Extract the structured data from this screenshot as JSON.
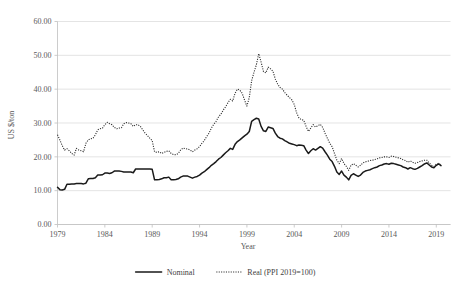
{
  "chart_data": {
    "type": "line",
    "title": "",
    "xlabel": "Year",
    "ylabel": "US $/ton",
    "xlim": [
      1979,
      2020.5
    ],
    "ylim": [
      0,
      60
    ],
    "grid": true,
    "legend_position": "bottom",
    "xticks": [
      "1979",
      "1984",
      "1989",
      "1994",
      "1999",
      "2004",
      "2009",
      "2014",
      "2019"
    ],
    "xtick_values": [
      1979,
      1984,
      1989,
      1994,
      1999,
      2004,
      2009,
      2014,
      2019
    ],
    "yticks": [
      "0.00",
      "10.00",
      "20.00",
      "30.00",
      "40.00",
      "50.00",
      "60.00"
    ],
    "ytick_values": [
      0,
      10,
      20,
      30,
      40,
      50,
      60
    ],
    "series": [
      {
        "name": "Nominal",
        "style": "solid",
        "color": "#1a1a1a",
        "x": [
          1979.0,
          1979.25,
          1979.5,
          1979.75,
          1980.0,
          1980.25,
          1980.5,
          1980.75,
          1981.0,
          1981.25,
          1981.5,
          1981.75,
          1982.0,
          1982.25,
          1982.5,
          1982.75,
          1983.0,
          1983.25,
          1983.5,
          1983.75,
          1984.0,
          1984.25,
          1984.5,
          1984.75,
          1985.0,
          1985.25,
          1985.5,
          1985.75,
          1986.0,
          1986.25,
          1986.5,
          1986.75,
          1987.0,
          1987.25,
          1987.5,
          1987.75,
          1988.0,
          1988.25,
          1988.5,
          1988.75,
          1989.0,
          1989.25,
          1989.5,
          1989.75,
          1990.0,
          1990.25,
          1990.5,
          1990.75,
          1991.0,
          1991.25,
          1991.5,
          1991.75,
          1992.0,
          1992.25,
          1992.5,
          1992.75,
          1993.0,
          1993.25,
          1993.5,
          1993.75,
          1994.0,
          1994.25,
          1994.5,
          1994.75,
          1995.0,
          1995.25,
          1995.5,
          1995.75,
          1996.0,
          1996.25,
          1996.5,
          1996.75,
          1997.0,
          1997.25,
          1997.5,
          1997.75,
          1998.0,
          1998.25,
          1998.5,
          1998.75,
          1999.0,
          1999.25,
          1999.5,
          1999.75,
          2000.0,
          2000.25,
          2000.5,
          2000.75,
          2001.0,
          2001.25,
          2001.5,
          2001.75,
          2002.0,
          2002.25,
          2002.5,
          2002.75,
          2003.0,
          2003.25,
          2003.5,
          2003.75,
          2004.0,
          2004.25,
          2004.5,
          2004.75,
          2005.0,
          2005.25,
          2005.5,
          2005.75,
          2006.0,
          2006.25,
          2006.5,
          2006.75,
          2007.0,
          2007.25,
          2007.5,
          2007.75,
          2008.0,
          2008.25,
          2008.5,
          2008.75,
          2009.0,
          2009.25,
          2009.5,
          2009.75,
          2010.0,
          2010.25,
          2010.5,
          2010.75,
          2011.0,
          2011.25,
          2011.5,
          2011.75,
          2012.0,
          2012.25,
          2012.5,
          2012.75,
          2013.0,
          2013.25,
          2013.5,
          2013.75,
          2014.0,
          2014.25,
          2014.5,
          2014.75,
          2015.0,
          2015.25,
          2015.5,
          2015.75,
          2016.0,
          2016.25,
          2016.5,
          2016.75,
          2017.0,
          2017.25,
          2017.5,
          2017.75,
          2018.0,
          2018.25,
          2018.5,
          2018.75,
          2019.0,
          2019.25,
          2019.5
        ],
        "values": [
          11.0,
          10.3,
          10.2,
          10.4,
          11.9,
          11.9,
          12.0,
          12.0,
          12.1,
          12.1,
          12.1,
          12.0,
          12.2,
          13.5,
          13.6,
          13.6,
          13.8,
          14.6,
          14.6,
          14.7,
          15.2,
          15.2,
          15.1,
          15.3,
          15.8,
          15.8,
          15.8,
          15.7,
          15.5,
          15.5,
          15.5,
          15.5,
          15.3,
          16.4,
          16.4,
          16.4,
          16.4,
          16.4,
          16.4,
          16.4,
          16.3,
          13.2,
          13.2,
          13.3,
          13.5,
          13.8,
          13.8,
          14.0,
          13.2,
          13.2,
          13.3,
          13.5,
          14.0,
          14.3,
          14.3,
          14.3,
          14.0,
          13.7,
          14.0,
          14.2,
          14.6,
          15.2,
          15.6,
          16.2,
          16.8,
          17.5,
          18.0,
          18.6,
          19.3,
          19.8,
          20.5,
          21.2,
          21.8,
          22.5,
          22.2,
          23.7,
          24.5,
          25.0,
          25.6,
          26.2,
          26.7,
          27.5,
          30.5,
          31.0,
          31.4,
          31.2,
          29.0,
          27.7,
          27.5,
          28.8,
          28.6,
          28.4,
          27.0,
          26.0,
          25.5,
          25.3,
          24.8,
          24.4,
          24.0,
          23.8,
          23.6,
          23.3,
          23.5,
          23.4,
          23.3,
          22.0,
          21.0,
          21.8,
          22.4,
          22.0,
          22.5,
          23.0,
          22.6,
          21.5,
          20.5,
          19.3,
          18.6,
          17.2,
          15.5,
          14.8,
          15.8,
          14.6,
          14.0,
          13.2,
          14.5,
          15.0,
          14.6,
          14.2,
          14.6,
          15.4,
          15.8,
          16.0,
          16.2,
          16.5,
          16.8,
          17.0,
          17.4,
          17.6,
          17.9,
          18.0,
          17.8,
          18.1,
          18.0,
          17.8,
          17.6,
          17.4,
          17.0,
          16.8,
          16.4,
          16.8,
          16.5,
          16.3,
          16.6,
          17.0,
          17.4,
          17.9,
          18.2,
          17.6,
          17.0,
          16.8,
          17.5,
          17.9,
          17.4
        ]
      },
      {
        "name": "Real (PPI 2019=100)",
        "style": "dotted",
        "color": "#2b2b2b",
        "x": [
          1979.0,
          1979.25,
          1979.5,
          1979.75,
          1980.0,
          1980.25,
          1980.5,
          1980.75,
          1981.0,
          1981.25,
          1981.5,
          1981.75,
          1982.0,
          1982.25,
          1982.5,
          1982.75,
          1983.0,
          1983.25,
          1983.5,
          1983.75,
          1984.0,
          1984.25,
          1984.5,
          1984.75,
          1985.0,
          1985.25,
          1985.5,
          1985.75,
          1986.0,
          1986.25,
          1986.5,
          1986.75,
          1987.0,
          1987.25,
          1987.5,
          1987.75,
          1988.0,
          1988.25,
          1988.5,
          1988.75,
          1989.0,
          1989.25,
          1989.5,
          1989.75,
          1990.0,
          1990.25,
          1990.5,
          1990.75,
          1991.0,
          1991.25,
          1991.5,
          1991.75,
          1992.0,
          1992.25,
          1992.5,
          1992.75,
          1993.0,
          1993.25,
          1993.5,
          1993.75,
          1994.0,
          1994.25,
          1994.5,
          1994.75,
          1995.0,
          1995.25,
          1995.5,
          1995.75,
          1996.0,
          1996.25,
          1996.5,
          1996.75,
          1997.0,
          1997.25,
          1997.5,
          1997.75,
          1998.0,
          1998.25,
          1998.5,
          1998.75,
          1999.0,
          1999.25,
          1999.5,
          1999.75,
          2000.0,
          2000.25,
          2000.5,
          2000.75,
          2001.0,
          2001.25,
          2001.5,
          2001.75,
          2002.0,
          2002.25,
          2002.5,
          2002.75,
          2003.0,
          2003.25,
          2003.5,
          2003.75,
          2004.0,
          2004.25,
          2004.5,
          2004.75,
          2005.0,
          2005.25,
          2005.5,
          2005.75,
          2006.0,
          2006.25,
          2006.5,
          2006.75,
          2007.0,
          2007.25,
          2007.5,
          2007.75,
          2008.0,
          2008.25,
          2008.5,
          2008.75,
          2009.0,
          2009.25,
          2009.5,
          2009.75,
          2010.0,
          2010.25,
          2010.5,
          2010.75,
          2011.0,
          2011.25,
          2011.5,
          2011.75,
          2012.0,
          2012.25,
          2012.5,
          2012.75,
          2013.0,
          2013.25,
          2013.5,
          2013.75,
          2014.0,
          2014.25,
          2014.5,
          2014.75,
          2015.0,
          2015.25,
          2015.5,
          2015.75,
          2016.0,
          2016.25,
          2016.5,
          2016.75,
          2017.0,
          2017.25,
          2017.5,
          2017.75,
          2018.0,
          2018.25,
          2018.5,
          2018.75,
          2019.0,
          2019.25,
          2019.5
        ],
        "values": [
          26.5,
          25.0,
          23.3,
          22.0,
          22.4,
          21.8,
          21.0,
          20.5,
          22.5,
          22.0,
          21.8,
          21.5,
          24.0,
          25.0,
          25.3,
          25.5,
          26.5,
          28.0,
          28.3,
          28.5,
          29.5,
          30.2,
          29.8,
          29.5,
          28.7,
          28.3,
          28.5,
          28.6,
          29.8,
          30.1,
          30.0,
          29.8,
          29.0,
          29.5,
          29.5,
          29.0,
          28.0,
          27.0,
          26.3,
          25.5,
          24.8,
          21.5,
          21.3,
          21.5,
          21.0,
          21.3,
          21.6,
          21.8,
          21.0,
          20.7,
          20.6,
          21.0,
          22.0,
          22.6,
          22.4,
          22.3,
          22.0,
          21.5,
          22.0,
          22.4,
          23.0,
          24.0,
          24.8,
          26.0,
          27.0,
          28.5,
          29.6,
          30.5,
          31.8,
          32.6,
          33.8,
          34.8,
          36.0,
          37.0,
          36.5,
          38.8,
          40.0,
          39.7,
          38.8,
          36.8,
          35.0,
          37.5,
          42.5,
          45.0,
          47.2,
          50.5,
          48.0,
          45.2,
          44.8,
          46.5,
          46.0,
          45.3,
          43.0,
          41.5,
          40.5,
          40.0,
          39.0,
          38.2,
          37.5,
          36.8,
          35.5,
          33.0,
          31.5,
          31.0,
          30.8,
          29.0,
          27.5,
          28.5,
          29.5,
          28.8,
          29.2,
          29.6,
          28.7,
          27.0,
          25.5,
          24.0,
          23.0,
          21.0,
          19.0,
          18.0,
          19.5,
          18.0,
          17.2,
          16.0,
          17.5,
          18.0,
          17.5,
          17.0,
          17.5,
          18.2,
          18.5,
          18.7,
          18.9,
          19.0,
          19.2,
          19.4,
          19.7,
          19.8,
          20.0,
          20.0,
          19.8,
          20.2,
          20.1,
          19.9,
          19.7,
          19.5,
          19.1,
          18.9,
          18.4,
          18.8,
          18.4,
          18.1,
          18.3,
          18.6,
          18.8,
          19.0,
          19.0,
          18.2,
          17.5,
          17.2,
          17.8,
          18.1,
          17.5
        ]
      }
    ]
  },
  "legend": {
    "items": [
      {
        "label": "Nominal",
        "style": "solid"
      },
      {
        "label": "Real (PPI 2019=100)",
        "style": "dotted"
      }
    ]
  }
}
